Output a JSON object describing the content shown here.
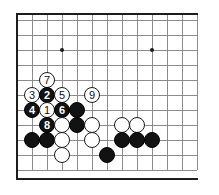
{
  "figure": {
    "kind": "go-board-diagram",
    "colors": {
      "background": "#ffffff",
      "grid": "#8c8c8c",
      "border": "#1d1d1d",
      "black_stone": "#121212",
      "white_stone": "#ffffff",
      "black_label": "#ffffff",
      "white_label": "#111111"
    },
    "geometry": {
      "origin_x": 17,
      "origin_y": 20,
      "spacing": 15,
      "cols": 13,
      "rows": 11,
      "stone_size": 16
    },
    "border": {
      "left_x": 16,
      "top_y": 13,
      "bottom_y": 178,
      "top_width": 182,
      "bottom_width": 182,
      "left_height": 166
    },
    "hoshi": [
      {
        "x": 62,
        "y": 50
      },
      {
        "x": 152,
        "y": 50
      }
    ],
    "stones": [
      {
        "color": "white",
        "label": "7",
        "cx": 47,
        "cy": 80
      },
      {
        "color": "white",
        "label": "3",
        "cx": 32,
        "cy": 95
      },
      {
        "color": "black",
        "label": "2",
        "cx": 47,
        "cy": 95
      },
      {
        "color": "white",
        "label": "5",
        "cx": 62,
        "cy": 95
      },
      {
        "color": "white",
        "label": "9",
        "cx": 92,
        "cy": 95
      },
      {
        "color": "black",
        "label": "4",
        "cx": 32,
        "cy": 110
      },
      {
        "color": "white",
        "label": "1",
        "cx": 47,
        "cy": 110
      },
      {
        "color": "black",
        "label": "6",
        "cx": 62,
        "cy": 110
      },
      {
        "color": "black",
        "label": "",
        "cx": 77,
        "cy": 110
      },
      {
        "color": "black",
        "label": "8",
        "cx": 47,
        "cy": 125
      },
      {
        "color": "white",
        "label": "",
        "cx": 62,
        "cy": 125
      },
      {
        "color": "black",
        "label": "",
        "cx": 77,
        "cy": 125
      },
      {
        "color": "white",
        "label": "",
        "cx": 92,
        "cy": 125
      },
      {
        "color": "white",
        "label": "",
        "cx": 122,
        "cy": 125
      },
      {
        "color": "white",
        "label": "",
        "cx": 137,
        "cy": 125
      },
      {
        "color": "black",
        "label": "",
        "cx": 32,
        "cy": 140
      },
      {
        "color": "black",
        "label": "",
        "cx": 47,
        "cy": 140
      },
      {
        "color": "white",
        "label": "",
        "cx": 62,
        "cy": 140
      },
      {
        "color": "white",
        "label": "",
        "cx": 92,
        "cy": 140
      },
      {
        "color": "black",
        "label": "",
        "cx": 122,
        "cy": 140
      },
      {
        "color": "black",
        "label": "",
        "cx": 137,
        "cy": 140
      },
      {
        "color": "black",
        "label": "",
        "cx": 152,
        "cy": 140
      },
      {
        "color": "white",
        "label": "",
        "cx": 62,
        "cy": 155
      },
      {
        "color": "black",
        "label": "",
        "cx": 107,
        "cy": 155
      }
    ]
  }
}
